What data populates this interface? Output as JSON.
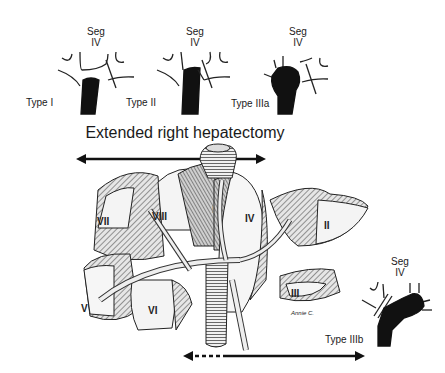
{
  "diagram": {
    "title": "Extended right hepatectomy",
    "types": [
      {
        "label": "Type I",
        "seg_label": [
          "Seg",
          "IV"
        ]
      },
      {
        "label": "Type II",
        "seg_label": [
          "Seg",
          "IV"
        ]
      },
      {
        "label": "Type IIIa",
        "seg_label": [
          "Seg",
          "IV"
        ]
      },
      {
        "label": "Type IIIb",
        "seg_label": [
          "Seg",
          "IV"
        ]
      }
    ],
    "segments": [
      "I",
      "II",
      "III",
      "IV",
      "V",
      "VI",
      "VII",
      "VIII"
    ],
    "signature": "Annie C.",
    "colors": {
      "ink": "#1a1a1a",
      "liver_shade": "#9a9a9a",
      "liver_light": "#e8e8e8",
      "background": "#ffffff"
    }
  }
}
